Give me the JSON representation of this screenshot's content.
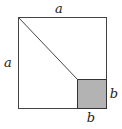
{
  "diagram": {
    "labels": {
      "top": "a",
      "left": "a",
      "right": "b",
      "bottom": "b"
    },
    "colors": {
      "stroke": "#333333",
      "shaded": "#b3b3b3"
    }
  }
}
